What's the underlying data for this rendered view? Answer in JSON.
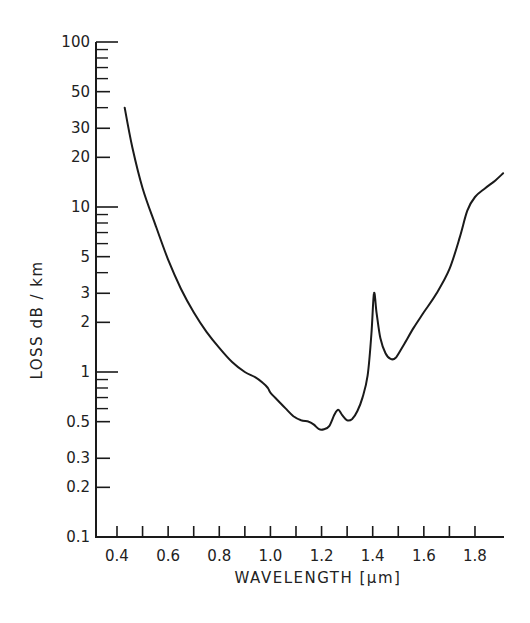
{
  "chart_data": {
    "type": "line",
    "title": "",
    "xlabel": "WAVELENGTH [μm]",
    "ylabel": "LOSS  dB / km",
    "xscale": "linear",
    "yscale": "log",
    "xlim": [
      0.3,
      1.92
    ],
    "ylim": [
      0.1,
      100
    ],
    "grid": false,
    "legend": null,
    "x_ticks": [
      0.4,
      0.5,
      0.6,
      0.7,
      0.8,
      0.9,
      1.0,
      1.1,
      1.2,
      1.3,
      1.4,
      1.5,
      1.6,
      1.7,
      1.8
    ],
    "x_tick_labels": [
      "0.4",
      "",
      "0.6",
      "",
      "0.8",
      "",
      "1.0",
      "",
      "1.2",
      "",
      "1.4",
      "",
      "1.6",
      "",
      "1.8"
    ],
    "y_major_ticks": [
      0.1,
      0.2,
      0.3,
      0.5,
      1,
      2,
      3,
      5,
      10,
      20,
      30,
      50,
      100
    ],
    "y_tick_labels": [
      "0.1",
      "0.2",
      "0.3",
      "0.5",
      "1",
      "2",
      "3",
      "5",
      "10",
      "20",
      "30",
      "50",
      "100"
    ],
    "y_minor_ticks": [
      0.6,
      0.7,
      0.8,
      0.9,
      4,
      6,
      7,
      8,
      9,
      40,
      60,
      70,
      80,
      90
    ],
    "series": [
      {
        "name": "Fiber loss",
        "x": [
          0.43,
          0.46,
          0.5,
          0.55,
          0.6,
          0.65,
          0.7,
          0.75,
          0.8,
          0.85,
          0.9,
          0.94,
          0.97,
          0.99,
          1.0,
          1.03,
          1.06,
          1.09,
          1.12,
          1.15,
          1.17,
          1.19,
          1.21,
          1.23,
          1.25,
          1.265,
          1.28,
          1.3,
          1.32,
          1.34,
          1.36,
          1.38,
          1.395,
          1.405,
          1.415,
          1.43,
          1.45,
          1.47,
          1.49,
          1.52,
          1.56,
          1.6,
          1.65,
          1.7,
          1.74,
          1.77,
          1.8,
          1.84,
          1.88,
          1.91
        ],
        "y": [
          40,
          23,
          13,
          7.8,
          4.8,
          3.2,
          2.3,
          1.75,
          1.4,
          1.15,
          1.0,
          0.93,
          0.86,
          0.8,
          0.75,
          0.67,
          0.6,
          0.54,
          0.51,
          0.5,
          0.48,
          0.45,
          0.45,
          0.47,
          0.55,
          0.59,
          0.55,
          0.51,
          0.52,
          0.58,
          0.7,
          0.95,
          1.7,
          3.0,
          2.3,
          1.6,
          1.3,
          1.2,
          1.22,
          1.45,
          1.85,
          2.3,
          3.0,
          4.2,
          6.5,
          9.5,
          11.5,
          13,
          14.5,
          16
        ]
      }
    ]
  },
  "axes": {
    "x_title": "WAVELENGTH [μm]",
    "y_title": "LOSS  dB / km"
  }
}
